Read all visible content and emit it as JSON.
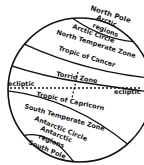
{
  "diagram": {
    "colors": {
      "ink": "#111111",
      "background": "#ffffff"
    },
    "labels": {
      "north_pole": "North Pole",
      "arctic_regions_1": "Arctic",
      "arctic_regions_2": "regions",
      "arctic_circle": "Arctic Circle",
      "north_temperate": "North Temperate Zone",
      "tropic_cancer": "Tropic of Cancer",
      "ecliptic_left": "ecliptic",
      "torrid": "Torrid Zone",
      "ecliptic_right": "ecliptic",
      "tropic_capricorn": "Tropic of Capricorn",
      "south_temperate": "South Temperate Zone",
      "antarctic_circle": "Antarctic Circle",
      "antarctic_regions_1": "Antarctic",
      "antarctic_regions_2": "regions",
      "south_pole": "South Pole"
    }
  }
}
